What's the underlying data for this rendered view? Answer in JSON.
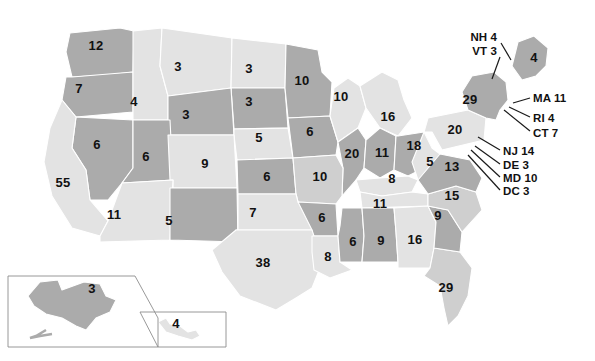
{
  "map": {
    "title": "United States Electoral College Map",
    "projection": "albers-usa",
    "colors": {
      "background": "#ffffff",
      "light_shade": "#e3e3e3",
      "medium_shade": "#cfcfcf",
      "dark_shade": "#ababab",
      "border": "#ffffff",
      "inset_border": "#8d8d8d",
      "label_text": "#111111",
      "leader_line": "#1a1a1a"
    },
    "states": [
      {
        "code": "WA",
        "name": "Washington",
        "value": "12",
        "shade": "dark",
        "x": 96,
        "y": 45
      },
      {
        "code": "OR",
        "name": "Oregon",
        "value": "7",
        "shade": "dark",
        "x": 79,
        "y": 88
      },
      {
        "code": "ID",
        "name": "Idaho",
        "value": "4",
        "shade": "light",
        "x": 134,
        "y": 101
      },
      {
        "code": "MT",
        "name": "Montana",
        "value": "3",
        "shade": "light",
        "x": 178,
        "y": 66
      },
      {
        "code": "ND",
        "name": "North Dakota",
        "value": "3",
        "shade": "light",
        "x": 249,
        "y": 68
      },
      {
        "code": "SD",
        "name": "South Dakota",
        "value": "3",
        "shade": "dark",
        "x": 249,
        "y": 101
      },
      {
        "code": "MN",
        "name": "Minnesota",
        "value": "10",
        "shade": "dark",
        "x": 302,
        "y": 80
      },
      {
        "code": "WY",
        "name": "Wyoming",
        "value": "3",
        "shade": "dark",
        "x": 186,
        "y": 114
      },
      {
        "code": "NE",
        "name": "Nebraska",
        "value": "5",
        "shade": "light",
        "x": 259,
        "y": 137
      },
      {
        "code": "IA",
        "name": "Iowa",
        "value": "6",
        "shade": "dark",
        "x": 310,
        "y": 131
      },
      {
        "code": "WI",
        "name": "Wisconsin",
        "value": "10",
        "shade": "light",
        "x": 341,
        "y": 96
      },
      {
        "code": "MI",
        "name": "Michigan",
        "value": "16",
        "shade": "light",
        "x": 388,
        "y": 116
      },
      {
        "code": "IL",
        "name": "Illinois",
        "value": "20",
        "shade": "dark",
        "x": 352,
        "y": 153
      },
      {
        "code": "IN",
        "name": "Indiana",
        "value": "11",
        "shade": "dark",
        "x": 382,
        "y": 152
      },
      {
        "code": "OH",
        "name": "Ohio",
        "value": "18",
        "shade": "dark",
        "x": 414,
        "y": 145
      },
      {
        "code": "NV",
        "name": "Nevada",
        "value": "6",
        "shade": "dark",
        "x": 97,
        "y": 144
      },
      {
        "code": "UT",
        "name": "Utah",
        "value": "6",
        "shade": "dark",
        "x": 146,
        "y": 156
      },
      {
        "code": "CO",
        "name": "Colorado",
        "value": "9",
        "shade": "light",
        "x": 205,
        "y": 163
      },
      {
        "code": "KS",
        "name": "Kansas",
        "value": "6",
        "shade": "dark",
        "x": 267,
        "y": 176
      },
      {
        "code": "MO",
        "name": "Missouri",
        "value": "10",
        "shade": "medium",
        "x": 320,
        "y": 176
      },
      {
        "code": "KY",
        "name": "Kentucky",
        "value": "8",
        "shade": "light",
        "x": 392,
        "y": 178
      },
      {
        "code": "WV",
        "name": "West Virginia",
        "value": "5",
        "shade": "light",
        "x": 430,
        "y": 161
      },
      {
        "code": "CA",
        "name": "California",
        "value": "55",
        "shade": "light",
        "x": 63,
        "y": 182
      },
      {
        "code": "AZ",
        "name": "Arizona",
        "value": "11",
        "shade": "light",
        "x": 114,
        "y": 214
      },
      {
        "code": "NM",
        "name": "New Mexico",
        "value": "5",
        "shade": "dark",
        "x": 169,
        "y": 220
      },
      {
        "code": "OK",
        "name": "Oklahoma",
        "value": "7",
        "shade": "light",
        "x": 253,
        "y": 212
      },
      {
        "code": "AR",
        "name": "Arkansas",
        "value": "6",
        "shade": "dark",
        "x": 322,
        "y": 217
      },
      {
        "code": "TN",
        "name": "Tennessee",
        "value": "11",
        "shade": "light",
        "x": 380,
        "y": 203
      },
      {
        "code": "TX",
        "name": "Texas",
        "value": "38",
        "shade": "light",
        "x": 263,
        "y": 262
      },
      {
        "code": "LA",
        "name": "Louisiana",
        "value": "8",
        "shade": "light",
        "x": 328,
        "y": 256
      },
      {
        "code": "MS",
        "name": "Mississippi",
        "value": "6",
        "shade": "dark",
        "x": 353,
        "y": 241
      },
      {
        "code": "AL",
        "name": "Alabama",
        "value": "9",
        "shade": "dark",
        "x": 381,
        "y": 240
      },
      {
        "code": "GA",
        "name": "Georgia",
        "value": "16",
        "shade": "light",
        "x": 415,
        "y": 239
      },
      {
        "code": "FL",
        "name": "Florida",
        "value": "29",
        "shade": "medium",
        "x": 446,
        "y": 287
      },
      {
        "code": "SC",
        "name": "South Carolina",
        "value": "9",
        "shade": "dark",
        "x": 438,
        "y": 215
      },
      {
        "code": "NC",
        "name": "North Carolina",
        "value": "15",
        "shade": "medium",
        "x": 452,
        "y": 195
      },
      {
        "code": "VA",
        "name": "Virginia",
        "value": "13",
        "shade": "dark",
        "x": 452,
        "y": 166
      },
      {
        "code": "PA",
        "name": "Pennsylvania",
        "value": "20",
        "shade": "light",
        "x": 455,
        "y": 129
      },
      {
        "code": "NY",
        "name": "New York",
        "value": "29",
        "shade": "dark",
        "x": 470,
        "y": 99
      },
      {
        "code": "ME",
        "name": "Maine",
        "value": "4",
        "shade": "dark",
        "x": 534,
        "y": 57
      },
      {
        "code": "AK",
        "name": "Alaska",
        "value": "3",
        "shade": "dark",
        "x": 92,
        "y": 288
      },
      {
        "code": "HI",
        "name": "Hawaii",
        "value": "4",
        "shade": "light",
        "x": 176,
        "y": 323
      }
    ],
    "callouts": [
      {
        "code": "NH",
        "name": "New Hampshire",
        "label": "NH 4",
        "align": "right",
        "label_x": 497,
        "label_y": 38,
        "line": "501,43 511,60"
      },
      {
        "code": "VT",
        "name": "Vermont",
        "label": "VT 3",
        "align": "right",
        "label_x": 497,
        "label_y": 52,
        "line": "500,57 492,79"
      },
      {
        "code": "MA",
        "name": "Massachusetts",
        "label": "MA 11",
        "align": "left",
        "label_x": 533,
        "label_y": 99,
        "line": "530,98 513,103"
      },
      {
        "code": "RI",
        "name": "Rhode Island",
        "label": "RI 4",
        "align": "left",
        "label_x": 533,
        "label_y": 119,
        "line": "530,117 509,107"
      },
      {
        "code": "CT",
        "name": "Connecticut",
        "label": "CT 7",
        "align": "left",
        "label_x": 533,
        "label_y": 134,
        "line": "530,131 504,110"
      },
      {
        "code": "NJ",
        "name": "New Jersey",
        "label": "NJ 14",
        "align": "left",
        "label_x": 503,
        "label_y": 152,
        "line": "500,150 478,137"
      },
      {
        "code": "DE",
        "name": "Delaware",
        "label": "DE 3",
        "align": "left",
        "label_x": 503,
        "label_y": 166,
        "line": "500,164 475,146"
      },
      {
        "code": "MD",
        "name": "Maryland",
        "label": "MD 10",
        "align": "left",
        "label_x": 503,
        "label_y": 179,
        "line": "500,177 471,150"
      },
      {
        "code": "DC",
        "name": "District of Columbia",
        "label": "DC 3",
        "align": "left",
        "label_x": 503,
        "label_y": 192,
        "line": "500,190 468,155"
      }
    ]
  }
}
